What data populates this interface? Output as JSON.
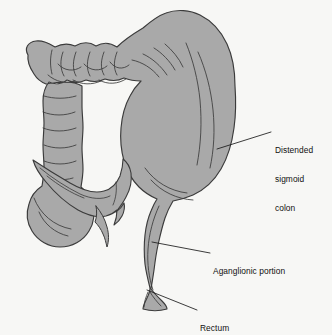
{
  "figure": {
    "kind": "anatomical-illustration",
    "subject": "colon",
    "background_color": "#f7f7f5",
    "organ_fill_color": "#a9a9a9",
    "organ_stroke_color": "#3b3b3b",
    "leader_line_color": "#1a1a1a",
    "label_text_color": "#101010"
  },
  "labels": {
    "sigmoid": {
      "name": "distended-sigmoid-colon",
      "line1": "Distended",
      "line2": "sigmoid",
      "line3": "colon"
    },
    "aganglionic": {
      "name": "aganglionic-portion",
      "line1": "Aganglionic portion"
    },
    "rectum": {
      "name": "rectum",
      "line1": "Rectum"
    }
  },
  "leaders": {
    "sigmoid": {
      "x1": 217,
      "y1": 149,
      "x2": 271,
      "y2": 132
    },
    "aganglionic": {
      "x1": 152,
      "y1": 242,
      "x2": 210,
      "y2": 253
    },
    "rectum": {
      "x1": 147,
      "y1": 290,
      "x2": 197,
      "y2": 310
    }
  }
}
